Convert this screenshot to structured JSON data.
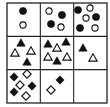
{
  "puzzle": {
    "type": "3x3 matrix reasoning",
    "grid": {
      "x": 7,
      "y": 3,
      "width": 100,
      "height": 100,
      "rows": 3,
      "cols": 3,
      "line_color": "#222222"
    },
    "fill_color": "#111111",
    "outline_color": "#111111",
    "cells": [
      {
        "row": 1,
        "col": 1,
        "shape": "circle",
        "items": [
          {
            "x": 23,
            "y": 11,
            "filled": true
          },
          {
            "x": 23,
            "y": 25,
            "filled": false
          }
        ]
      },
      {
        "row": 1,
        "col": 2,
        "shape": "circle",
        "items": [
          {
            "x": 49,
            "y": 11,
            "filled": false
          },
          {
            "x": 62,
            "y": 15,
            "filled": true
          },
          {
            "x": 51,
            "y": 24,
            "filled": true
          },
          {
            "x": 61,
            "y": 27,
            "filled": false
          }
        ]
      },
      {
        "row": 1,
        "col": 3,
        "shape": "circle",
        "items": [
          {
            "x": 78,
            "y": 10,
            "filled": true
          },
          {
            "x": 90,
            "y": 8,
            "filled": false
          },
          {
            "x": 86,
            "y": 18,
            "filled": false
          },
          {
            "x": 96,
            "y": 17,
            "filled": true
          },
          {
            "x": 80,
            "y": 28,
            "filled": true
          },
          {
            "x": 95,
            "y": 28,
            "filled": false
          }
        ]
      },
      {
        "row": 2,
        "col": 1,
        "shape": "triangle",
        "items": [
          {
            "x": 21,
            "y": 43,
            "filled": true
          },
          {
            "x": 15,
            "y": 53,
            "filled": false
          },
          {
            "x": 31,
            "y": 51,
            "filled": false
          },
          {
            "x": 27,
            "y": 62,
            "filled": true
          }
        ]
      },
      {
        "row": 2,
        "col": 2,
        "shape": "triangle",
        "items": [
          {
            "x": 48,
            "y": 44,
            "filled": true
          },
          {
            "x": 66,
            "y": 42,
            "filled": true
          },
          {
            "x": 57,
            "y": 48,
            "filled": false
          },
          {
            "x": 48,
            "y": 57,
            "filled": false
          },
          {
            "x": 67,
            "y": 57,
            "filled": false
          },
          {
            "x": 57,
            "y": 61,
            "filled": true
          }
        ]
      },
      {
        "row": 2,
        "col": 3,
        "shape": "triangle",
        "items": [
          {
            "x": 83,
            "y": 48,
            "filled": true
          },
          {
            "x": 93,
            "y": 58,
            "filled": false
          }
        ]
      },
      {
        "row": 3,
        "col": 1,
        "shape": "diamond",
        "items": [
          {
            "x": 14,
            "y": 77,
            "filled": true
          },
          {
            "x": 27,
            "y": 74,
            "filled": false
          },
          {
            "x": 20,
            "y": 85,
            "filled": false
          },
          {
            "x": 32,
            "y": 86,
            "filled": true
          },
          {
            "x": 14,
            "y": 92,
            "filled": true
          },
          {
            "x": 26,
            "y": 96,
            "filled": false
          }
        ]
      },
      {
        "row": 3,
        "col": 2,
        "shape": "diamond",
        "items": [
          {
            "x": 60,
            "y": 80,
            "filled": true
          },
          {
            "x": 51,
            "y": 90,
            "filled": false
          }
        ]
      },
      {
        "row": 3,
        "col": 3,
        "shape": "none",
        "items": [],
        "missing": true
      }
    ]
  }
}
